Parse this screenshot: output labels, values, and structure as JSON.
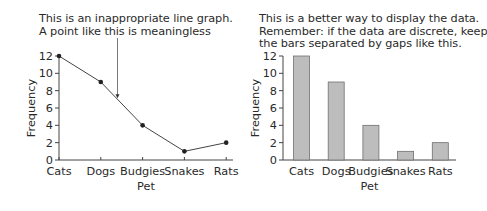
{
  "chart_data": [
    {
      "type": "line",
      "caption_lines": [
        "This is an inappropriate line graph.",
        "A point like this is meaningless"
      ],
      "categories": [
        "Cats",
        "Dogs",
        "Budgies",
        "Snakes",
        "Rats"
      ],
      "values": [
        12,
        9,
        4,
        1,
        2
      ],
      "xlabel": "Pet",
      "ylabel": "Frequency",
      "ylim": [
        0,
        12
      ],
      "yticks": [
        0,
        2,
        4,
        6,
        8,
        10,
        12
      ],
      "annotation": {
        "text": "A point like this is meaningless",
        "points_between": [
          "Dogs",
          "Budgies"
        ],
        "value": 7
      }
    },
    {
      "type": "bar",
      "caption_lines": [
        "This is a better way to display the data.",
        "Remember: if the data are discrete, keep",
        "the bars separated by gaps like this."
      ],
      "categories": [
        "Cats",
        "Dogs",
        "Budgies",
        "Snakes",
        "Rats"
      ],
      "values": [
        12,
        9,
        4,
        1,
        2
      ],
      "xlabel": "Pet",
      "ylabel": "Frequency",
      "ylim": [
        0,
        12
      ],
      "yticks": [
        0,
        2,
        4,
        6,
        8,
        10,
        12
      ],
      "bar_color": "#bdbdbd",
      "bar_edge_color": "#707070"
    }
  ]
}
